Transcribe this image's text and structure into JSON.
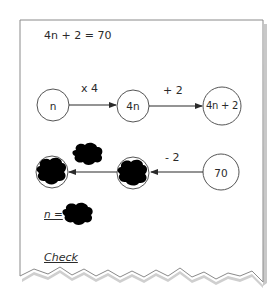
{
  "worksheet": {
    "equation": "4n + 2 = 70",
    "forward_flow": {
      "nodes": [
        {
          "label": "n"
        },
        {
          "label": "4n"
        },
        {
          "label": "4n + 2"
        }
      ],
      "operations": [
        {
          "label": "x 4"
        },
        {
          "label": "+ 2"
        }
      ]
    },
    "inverse_flow": {
      "nodes": [
        {
          "label": "",
          "state": "blotted-out"
        },
        {
          "label": "",
          "state": "blotted-out"
        },
        {
          "label": "70"
        }
      ],
      "operations": [
        {
          "label": "",
          "state": "blotted-out"
        },
        {
          "label": "- 2"
        }
      ]
    },
    "answer": {
      "label": "n =",
      "value": "",
      "value_state": "blotted-out"
    },
    "check_label": "Check"
  },
  "colors": {
    "ink": "#2a2a2a",
    "frame": "#8a8a8a",
    "shadow": "#c8c8c8",
    "blot": "#000000",
    "paper": "#ffffff"
  }
}
